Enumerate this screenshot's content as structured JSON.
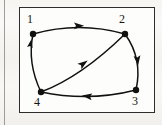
{
  "figure": {
    "kind": "directed-graph",
    "background_color": "#f7f6f3",
    "frame_color": "#2c2c2c",
    "ink_color": "#111111",
    "caption": ""
  },
  "graph": {
    "node_ids": [
      "1",
      "2",
      "3",
      "4"
    ],
    "nodes": [
      {
        "id": "1",
        "label": "1",
        "x": 14,
        "y": 27,
        "label_x": 8,
        "label_y": 6
      },
      {
        "id": "2",
        "label": "2",
        "x": 106,
        "y": 27,
        "label_x": 100,
        "label_y": 6
      },
      {
        "id": "3",
        "label": "3",
        "x": 117,
        "y": 83,
        "label_x": 113,
        "label_y": 88
      },
      {
        "id": "4",
        "label": "4",
        "x": 22,
        "y": 85,
        "label_x": 15,
        "label_y": 89
      }
    ],
    "edges": [
      {
        "from": "1",
        "to": "2",
        "arrow_direction": "right",
        "curve": "bow-up",
        "arrow_t": 0.52
      },
      {
        "from": "2",
        "to": "3",
        "arrow_direction": "down",
        "curve": "bow-right",
        "arrow_t": 0.5
      },
      {
        "from": "3",
        "to": "4",
        "arrow_direction": "left",
        "curve": "bow-down",
        "arrow_t": 0.52
      },
      {
        "from": "4",
        "to": "1",
        "arrow_direction": "up",
        "curve": "bow-left",
        "arrow_t": 0.82
      },
      {
        "from": "4",
        "to": "2",
        "arrow_direction": "up-right",
        "curve": "bow-slight",
        "arrow_t": 0.52
      }
    ],
    "node_radius": 3.2,
    "edge_width": 1.5
  }
}
